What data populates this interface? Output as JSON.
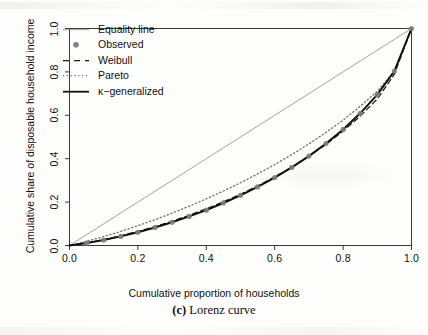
{
  "figure": {
    "caption_tag": "(c)",
    "caption_text": "Lorenz curve"
  },
  "axes": {
    "x_title": "Cumulative proportion of households",
    "y_title": "Cumulative share of disposable household income",
    "x_ticks": [
      "0.0",
      "0.2",
      "0.4",
      "0.6",
      "0.8",
      "1.0"
    ],
    "y_ticks": [
      "0.0",
      "0.2",
      "0.4",
      "0.6",
      "0.8",
      "1.0"
    ]
  },
  "legend": {
    "items": [
      {
        "label": "Equality line",
        "key": "thin-line-key",
        "color": "#8a8a8a"
      },
      {
        "label": "Observed",
        "key": "gray-dot-key",
        "color": "#808080"
      },
      {
        "label": "Weibull",
        "key": "dashed-line-key",
        "color": "#1a1a1a"
      },
      {
        "label": "Pareto",
        "key": "dotted-line-key",
        "color": "#6e6e6e"
      },
      {
        "label": "κ−generalized",
        "key": "solid-line-key",
        "color": "#111111"
      }
    ]
  },
  "chart_data": {
    "type": "line",
    "title": "",
    "xlabel": "Cumulative proportion of households",
    "ylabel": "Cumulative share of disposable household income",
    "xlim": [
      0.0,
      1.0
    ],
    "ylim": [
      0.0,
      1.0
    ],
    "grid": false,
    "legend_position": "top-left",
    "x": [
      0.0,
      0.05,
      0.1,
      0.15,
      0.2,
      0.25,
      0.3,
      0.35,
      0.4,
      0.45,
      0.5,
      0.55,
      0.6,
      0.65,
      0.7,
      0.75,
      0.8,
      0.85,
      0.9,
      0.95,
      1.0
    ],
    "series": [
      {
        "name": "Equality line",
        "style": "solid-thin",
        "color": "#8a8a8a",
        "values": [
          0.0,
          0.05,
          0.1,
          0.15,
          0.2,
          0.25,
          0.3,
          0.35,
          0.4,
          0.45,
          0.5,
          0.55,
          0.6,
          0.65,
          0.7,
          0.75,
          0.8,
          0.85,
          0.9,
          0.95,
          1.0
        ]
      },
      {
        "name": "Pareto",
        "style": "dotted",
        "color": "#6e6e6e",
        "values": [
          0.0,
          0.019,
          0.041,
          0.065,
          0.091,
          0.119,
          0.149,
          0.181,
          0.215,
          0.251,
          0.289,
          0.33,
          0.373,
          0.419,
          0.468,
          0.521,
          0.578,
          0.641,
          0.711,
          0.803,
          1.0
        ]
      },
      {
        "name": "Weibull",
        "style": "dashed",
        "color": "#1a1a1a",
        "values": [
          0.0,
          0.012,
          0.027,
          0.045,
          0.065,
          0.087,
          0.112,
          0.139,
          0.169,
          0.201,
          0.236,
          0.274,
          0.316,
          0.361,
          0.411,
          0.466,
          0.527,
          0.596,
          0.675,
          0.79,
          1.0
        ]
      },
      {
        "name": "κ−generalized",
        "style": "solid-thick",
        "color": "#111111",
        "values": [
          0.0,
          0.011,
          0.025,
          0.042,
          0.061,
          0.083,
          0.107,
          0.134,
          0.163,
          0.196,
          0.231,
          0.27,
          0.313,
          0.36,
          0.412,
          0.47,
          0.535,
          0.609,
          0.695,
          0.804,
          1.0
        ]
      },
      {
        "name": "Observed",
        "style": "points",
        "color": "#808080",
        "values": [
          0.0,
          0.011,
          0.025,
          0.042,
          0.061,
          0.083,
          0.107,
          0.134,
          0.163,
          0.196,
          0.231,
          0.27,
          0.313,
          0.36,
          0.412,
          0.47,
          0.535,
          0.609,
          0.695,
          0.804,
          1.0
        ]
      }
    ]
  }
}
